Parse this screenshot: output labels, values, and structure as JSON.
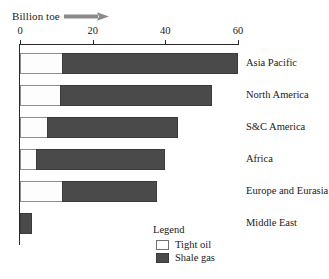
{
  "axis_caption": {
    "text": "Billion toe",
    "arrow_icon": "right-arrow-icon"
  },
  "legend": {
    "title": "Legend",
    "items": [
      {
        "label": "Tight oil",
        "color": "#fdfdfd",
        "swatch_icon": "legend-swatch-tight-oil"
      },
      {
        "label": "Shale gas",
        "color": "#4a4a4a",
        "swatch_icon": "legend-swatch-shale-gas"
      }
    ]
  },
  "chart_data": {
    "type": "bar",
    "orientation": "horizontal",
    "stacked": true,
    "title": "",
    "subtitle": "",
    "xlabel": "Billion toe",
    "ylabel": "",
    "xlim": [
      0,
      60
    ],
    "xticks": [
      0,
      20,
      40,
      60
    ],
    "xtick_labels": [
      "0",
      "20",
      "40",
      "60"
    ],
    "grid": false,
    "legend_position": "bottom-center",
    "categories": [
      "Asia Pacific",
      "North America",
      "S&C America",
      "Africa",
      "Europe and Eurasia",
      "Middle East"
    ],
    "series": [
      {
        "name": "Tight oil",
        "color": "#fdfdfd",
        "values": [
          11.5,
          11.0,
          7.4,
          4.4,
          11.5,
          0.0
        ]
      },
      {
        "name": "Shale gas",
        "color": "#4a4a4a",
        "values": [
          48.5,
          41.8,
          36.1,
          35.5,
          26.2,
          3.3
        ]
      }
    ],
    "totals": [
      60.0,
      52.8,
      43.5,
      39.9,
      37.7,
      3.3
    ]
  }
}
